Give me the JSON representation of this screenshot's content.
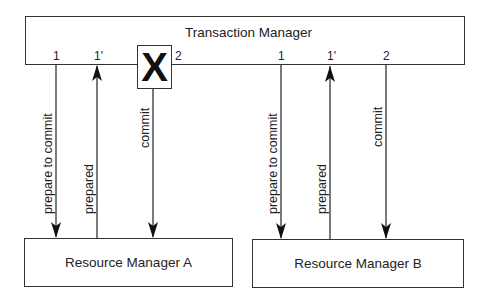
{
  "transaction_manager": {
    "title": "Transaction Manager",
    "failure_marker": "X"
  },
  "resource_managers": [
    {
      "name": "Resource Manager A",
      "messages": [
        {
          "step": "1",
          "label": "prepare to commit",
          "direction": "down"
        },
        {
          "step": "1'",
          "label": "prepared",
          "direction": "up"
        },
        {
          "step": "2",
          "label": "commit",
          "direction": "down"
        }
      ]
    },
    {
      "name": "Resource Manager B",
      "messages": [
        {
          "step": "1",
          "label": "prepare to commit",
          "direction": "down"
        },
        {
          "step": "1'",
          "label": "prepared",
          "direction": "up"
        },
        {
          "step": "2",
          "label": "commit",
          "direction": "down"
        }
      ]
    }
  ],
  "colors": {
    "line": "#333333",
    "background": "#ffffff"
  }
}
